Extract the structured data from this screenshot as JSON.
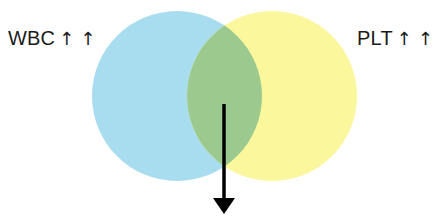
{
  "diagram": {
    "type": "venn",
    "sets": [
      {
        "id": "wbc",
        "label": "WBC",
        "indicator": "↑ ↑",
        "color": "#a8dcef"
      },
      {
        "id": "plt",
        "label": "PLT",
        "indicator": "↑ ↑",
        "color": "#fbf79c"
      }
    ],
    "intersection": {
      "color": "#9cc98e",
      "indicator": "down-arrow"
    }
  },
  "labels": {
    "left": {
      "text": "WBC",
      "arrows": "↑ ↑"
    },
    "right": {
      "text": "PLT",
      "arrows": "↑ ↑"
    }
  }
}
